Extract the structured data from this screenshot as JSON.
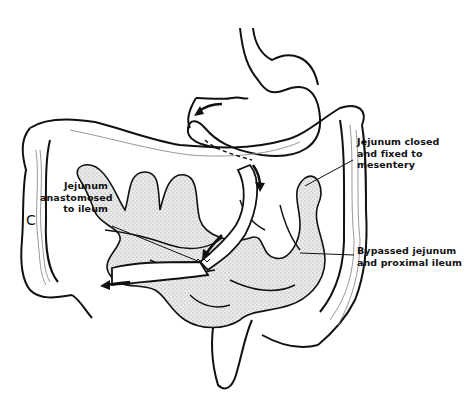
{
  "figure": {
    "panel_letter": "C",
    "labels": {
      "jejunum_closed": [
        "Jejunum closed",
        "and fixed to",
        "mesentery"
      ],
      "jejunum_anastomosed": [
        "Jejunum",
        "anastomosed",
        "to ileum"
      ],
      "bypassed": [
        "Bypassed jejunum",
        "and proximal ileum"
      ]
    },
    "colors": {
      "line": "#111111",
      "stipple": "#9a9a9a",
      "fill": "#e6e6e6",
      "background": "#ffffff"
    }
  }
}
